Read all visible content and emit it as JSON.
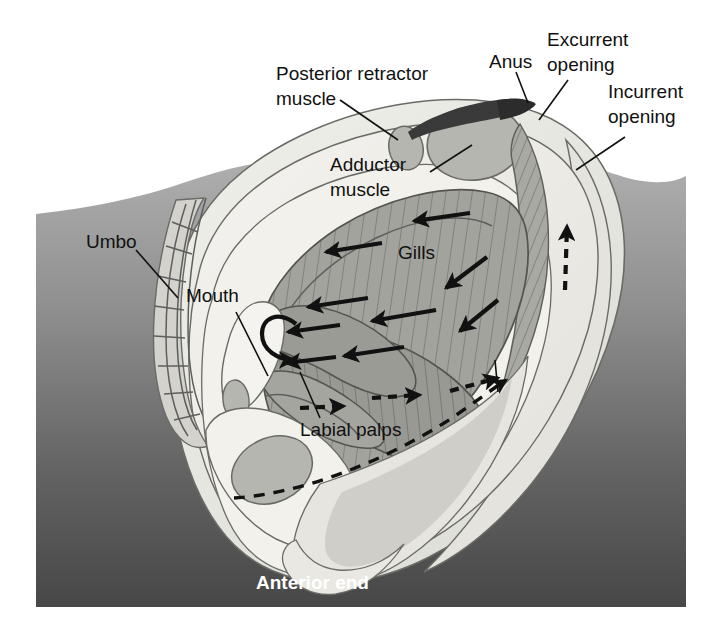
{
  "figure": {
    "width": 717,
    "height": 640
  },
  "labels": {
    "posterior_retractor_muscle": "Posterior retractor\nmuscle",
    "posterior_retractor_muscle_line1": "Posterior retractor",
    "posterior_retractor_muscle_line2": "muscle",
    "anus": "Anus",
    "excurrent_opening_line1": "Excurrent",
    "excurrent_opening_line2": "opening",
    "incurrent_opening_line1": "Incurrent",
    "incurrent_opening_line2": "opening",
    "adductor_muscle_line1": "Adductor",
    "adductor_muscle_line2": "muscle",
    "umbo": "Umbo",
    "mouth": "Mouth",
    "gills": "Gills",
    "labial_palps": "Labial palps",
    "anterior_end": "Anterior end"
  },
  "colors": {
    "background_page": "#ffffff",
    "substrate_top": "#a8a8a8",
    "substrate_bottom": "#4e4e4e",
    "shell_outer": "#e8e8e4",
    "mantle_light": "#dededa",
    "body_pale": "#f2f1ec",
    "visceral_mid": "#c9c9c4",
    "gill_fill": "#a0a09c",
    "gill_fill_dark": "#8e8e8a",
    "muscle_fill": "#b4b4ae",
    "anus_dark": "#3a3a3a",
    "outline_stroke": "#5e5e5e",
    "text_dark": "#111111",
    "text_light": "#ffffff",
    "arrow": "#111111"
  },
  "flow_legend": {
    "solid_arrows_meaning": "water current over gills",
    "dashed_arrows_meaning": "food / particle transport path",
    "solid_arrow_count": 11,
    "dashed_arrow_count": 5
  },
  "anatomy_parts": [
    "shell",
    "umbo",
    "mantle",
    "adductor muscle",
    "posterior retractor muscle",
    "anus",
    "excurrent opening",
    "incurrent opening",
    "gills",
    "labial palps",
    "mouth",
    "foot",
    "anterior end"
  ]
}
